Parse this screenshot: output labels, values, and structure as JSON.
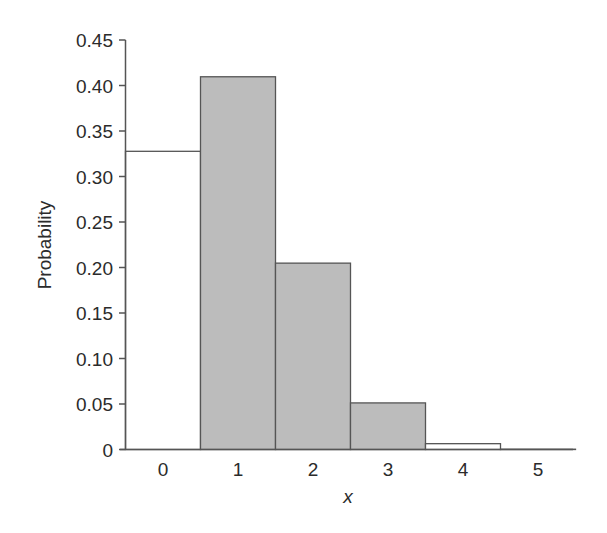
{
  "chart_data": {
    "type": "bar",
    "title": "",
    "xlabel": "x",
    "ylabel": "Probability",
    "categories": [
      "0",
      "1",
      "2",
      "3",
      "4",
      "5"
    ],
    "values": [
      0.32768,
      0.4096,
      0.2048,
      0.0512,
      0.0064,
      0.00032
    ],
    "shaded": [
      false,
      true,
      true,
      true,
      false,
      false
    ],
    "ylim": [
      0,
      0.45
    ],
    "yticks": [
      "0",
      "0.05",
      "0.10",
      "0.15",
      "0.20",
      "0.25",
      "0.30",
      "0.35",
      "0.40",
      "0.45"
    ],
    "ytick_values": [
      0,
      0.05,
      0.1,
      0.15,
      0.2,
      0.25,
      0.3,
      0.35,
      0.4,
      0.45
    ],
    "grid": false,
    "legend": null,
    "colors": {
      "shaded_fill": "#bcbcbc",
      "unshaded_fill": "#ffffff",
      "bar_stroke": "#555555",
      "axis": "#555555",
      "text": "#2b2b2b"
    }
  }
}
